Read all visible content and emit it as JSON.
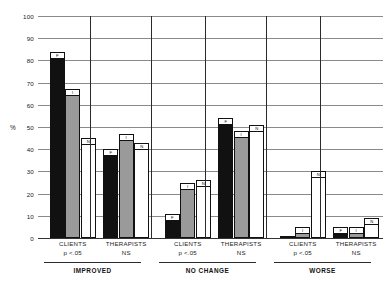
{
  "chart_data": {
    "type": "bar",
    "title": "",
    "subtitle": "",
    "xlabel": "",
    "ylabel": "%",
    "ylim": [
      0,
      100
    ],
    "ytick_step": 10,
    "ytick_labels": [
      "0",
      "10",
      "20",
      "30",
      "40",
      "50",
      "60",
      "70",
      "80",
      "90",
      "100"
    ],
    "grid": true,
    "legend_position": "none",
    "legend": [
      {
        "name": "F",
        "color": "#111111",
        "style": "solid-black"
      },
      {
        "name": "I",
        "color": "#9a9a9a",
        "style": "solid-gray"
      },
      {
        "name": "N",
        "color": "#ffffff",
        "style": "outline-white"
      }
    ],
    "series": [
      {
        "name": "F",
        "values": [
          84,
          40,
          11,
          54,
          1,
          5
        ]
      },
      {
        "name": "I",
        "values": [
          67,
          47,
          25,
          48,
          5,
          5
        ]
      },
      {
        "name": "N",
        "values": [
          45,
          43,
          26,
          51,
          30,
          9
        ]
      }
    ],
    "categories": [
      "IMPROVED / CLIENTS",
      "IMPROVED / THERAPISTS",
      "NO CHANGE / CLIENTS",
      "NO CHANGE / THERAPISTS",
      "WORSE / CLIENTS",
      "WORSE / THERAPISTS"
    ],
    "sections": [
      {
        "title": "IMPROVED",
        "groups": [
          {
            "label": "CLIENTS",
            "sublabel": "p <.05",
            "bars": [
              {
                "tag": "F",
                "value": 84
              },
              {
                "tag": "I",
                "value": 67
              },
              {
                "tag": "N",
                "value": 45
              }
            ]
          },
          {
            "label": "THERAPISTS",
            "sublabel": "NS",
            "bars": [
              {
                "tag": "F",
                "value": 40
              },
              {
                "tag": "I",
                "value": 47
              },
              {
                "tag": "N",
                "value": 43
              }
            ]
          }
        ]
      },
      {
        "title": "NO CHANGE",
        "groups": [
          {
            "label": "CLIENTS",
            "sublabel": "p <.05",
            "bars": [
              {
                "tag": "F",
                "value": 11
              },
              {
                "tag": "I",
                "value": 25
              },
              {
                "tag": "N",
                "value": 26
              }
            ]
          },
          {
            "label": "THERAPISTS",
            "sublabel": "NS",
            "bars": [
              {
                "tag": "F",
                "value": 54
              },
              {
                "tag": "I",
                "value": 48
              },
              {
                "tag": "N",
                "value": 51
              }
            ]
          }
        ]
      },
      {
        "title": "WORSE",
        "groups": [
          {
            "label": "CLIENTS",
            "sublabel": "p <.05",
            "bars": [
              {
                "tag": "F",
                "value": 1
              },
              {
                "tag": "I",
                "value": 5
              },
              {
                "tag": "N",
                "value": 30
              }
            ]
          },
          {
            "label": "THERAPISTS",
            "sublabel": "NS",
            "bars": [
              {
                "tag": "F",
                "value": 5
              },
              {
                "tag": "I",
                "value": 5
              },
              {
                "tag": "N",
                "value": 9
              }
            ]
          }
        ]
      }
    ]
  },
  "colors": {
    "bar_f": "#111111",
    "bar_i": "#9a9a9a",
    "bar_n": "#ffffff",
    "grid": "#8a8a8a",
    "axis": "#2b2b2b",
    "background": "#ffffff"
  }
}
